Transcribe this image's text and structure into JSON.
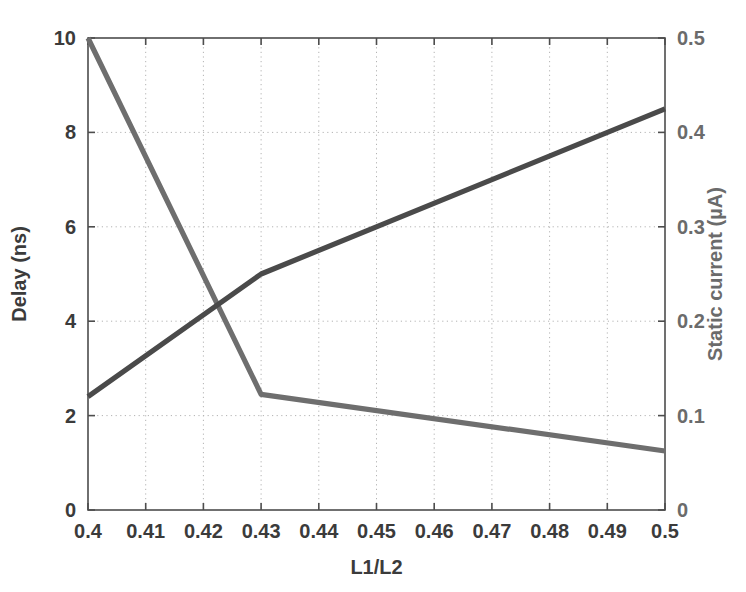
{
  "chart_data": {
    "type": "line",
    "title": "",
    "subtitle": "",
    "xlabel": "L1/L2",
    "ylabel": "Delay (ns)",
    "ylabel_right": "Static current (µA)",
    "xlim": [
      0.4,
      0.5
    ],
    "ylim": [
      0,
      10
    ],
    "ylim_right": [
      0,
      0.5
    ],
    "grid": true,
    "grid_style": "dotted",
    "legend": "none",
    "xticks": [
      0.4,
      0.41,
      0.42,
      0.43,
      0.44,
      0.45,
      0.46,
      0.47,
      0.48,
      0.49,
      0.5
    ],
    "xticklabels": [
      "0.4",
      "0.41",
      "0.42",
      "0.43",
      "0.44",
      "0.45",
      "0.46",
      "0.47",
      "0.48",
      "0.49",
      "0.5"
    ],
    "yticks": [
      0,
      2,
      4,
      6,
      8,
      10
    ],
    "yticklabels": [
      "0",
      "2",
      "4",
      "6",
      "8",
      "10"
    ],
    "yticks_right": [
      0,
      0.1,
      0.2,
      0.3,
      0.4,
      0.5
    ],
    "yticklabels_right": [
      "0",
      "0.1",
      "0.2",
      "0.3",
      "0.4",
      "0.5"
    ],
    "series": [
      {
        "name": "Delay (ns)",
        "axis": "left",
        "color": "#6e6e6e",
        "x": [
          0.4,
          0.43,
          0.5
        ],
        "values": [
          10.0,
          2.45,
          1.25
        ]
      },
      {
        "name": "Static current (µA)",
        "axis": "right",
        "color": "#4a4a4a",
        "x": [
          0.4,
          0.43,
          0.5
        ],
        "values": [
          0.12,
          0.25,
          0.425
        ]
      }
    ],
    "annotations": []
  },
  "plot_area": {
    "left": 88,
    "top": 38,
    "right": 665,
    "bottom": 510
  }
}
